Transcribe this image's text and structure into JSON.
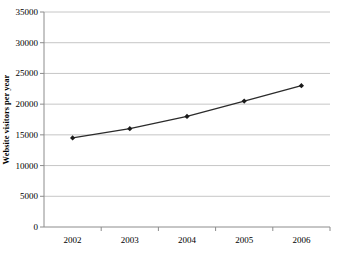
{
  "chart_data": {
    "type": "line",
    "title": "",
    "xlabel": "",
    "ylabel": "Website visitors per year",
    "categories": [
      "2002",
      "2003",
      "2004",
      "2005",
      "2006"
    ],
    "series": [
      {
        "name": "Website visitors",
        "values": [
          14500,
          16000,
          18000,
          20500,
          23000
        ]
      }
    ],
    "ylim": [
      0,
      35000
    ],
    "ytick_step": 5000,
    "ytick_labels": [
      "0",
      "5000",
      "10000",
      "15000",
      "20000",
      "25000",
      "30000",
      "35000"
    ],
    "grid": true,
    "legend": "none",
    "marker": "diamond",
    "colors": {
      "line": "#2b2b2b",
      "marker": "#1a1a1a",
      "gridline": "#c6c6c6",
      "axis": "#8c8c8c",
      "text": "#000000",
      "background": "#ffffff"
    }
  }
}
